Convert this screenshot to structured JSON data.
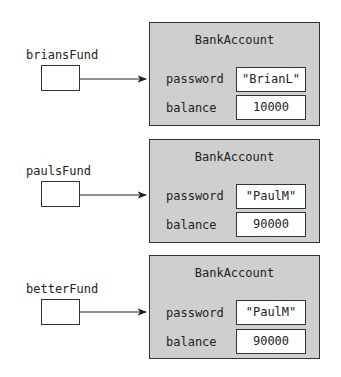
{
  "references": [
    {
      "variable": "briansFund",
      "object": {
        "class_name": "BankAccount",
        "fields": [
          {
            "name": "password",
            "value": "\"BrianL\""
          },
          {
            "name": "balance",
            "value": "10000"
          }
        ]
      }
    },
    {
      "variable": "paulsFund",
      "object": {
        "class_name": "BankAccount",
        "fields": [
          {
            "name": "password",
            "value": "\"PaulM\""
          },
          {
            "name": "balance",
            "value": "90000"
          }
        ]
      }
    },
    {
      "variable": "betterFund",
      "object": {
        "class_name": "BankAccount",
        "fields": [
          {
            "name": "password",
            "value": "\"PaulM\""
          },
          {
            "name": "balance",
            "value": "90000"
          }
        ]
      }
    }
  ]
}
